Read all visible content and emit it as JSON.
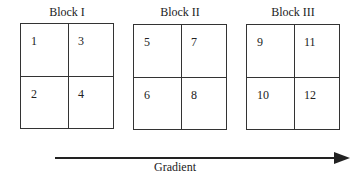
{
  "blocks": [
    {
      "title": "Block I",
      "plots": [
        "1",
        "3",
        "2",
        "4"
      ]
    },
    {
      "title": "Block II",
      "plots": [
        "5",
        "7",
        "6",
        "8"
      ]
    },
    {
      "title": "Block III",
      "plots": [
        "9",
        "11",
        "10",
        "12"
      ]
    }
  ],
  "arrow": {
    "label": "Gradient",
    "direction": "right"
  },
  "colors": {
    "line": "#333333",
    "background": "#ffffff"
  }
}
